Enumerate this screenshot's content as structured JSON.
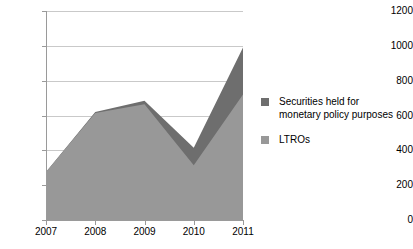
{
  "chart_data": {
    "type": "area",
    "stacked": true,
    "title": "",
    "subtitle": "",
    "xlabel": "",
    "ylabel": "",
    "categories": [
      "2007",
      "2008",
      "2009",
      "2010",
      "2011"
    ],
    "x": [
      2007,
      2008,
      2009,
      2010,
      2011
    ],
    "series": [
      {
        "name": "LTROs",
        "color": "#989898",
        "values": [
          275,
          615,
          665,
          315,
          720
        ]
      },
      {
        "name": "Securities held for monetary policy purposes",
        "color": "#6e6e6e",
        "values": [
          0,
          5,
          20,
          100,
          270
        ]
      }
    ],
    "cumulative_totals": [
      275,
      620,
      685,
      415,
      990
    ],
    "ylim": [
      0,
      1200
    ],
    "yticks": [
      0,
      200,
      400,
      600,
      800,
      1000,
      1200
    ],
    "ytick_labels": [
      "0",
      "200",
      "400",
      "600",
      "800",
      "1000",
      "1200"
    ],
    "xtick_labels": [
      "2007",
      "2008",
      "2009",
      "2010",
      "2011"
    ],
    "grid": "horizontal",
    "legend_position": "right",
    "legend": [
      {
        "label": "Securities held for\nmonetary policy purposes",
        "color": "#6e6e6e",
        "swatch": "square-swatch"
      },
      {
        "label": "LTROs",
        "color": "#989898",
        "swatch": "square-swatch"
      }
    ]
  },
  "colors": {
    "background": "#ffffff",
    "gridline": "#c9c9c9",
    "axis": "#9a9a9a",
    "text": "#000000",
    "series_dark": "#6e6e6e",
    "series_light": "#989898"
  }
}
